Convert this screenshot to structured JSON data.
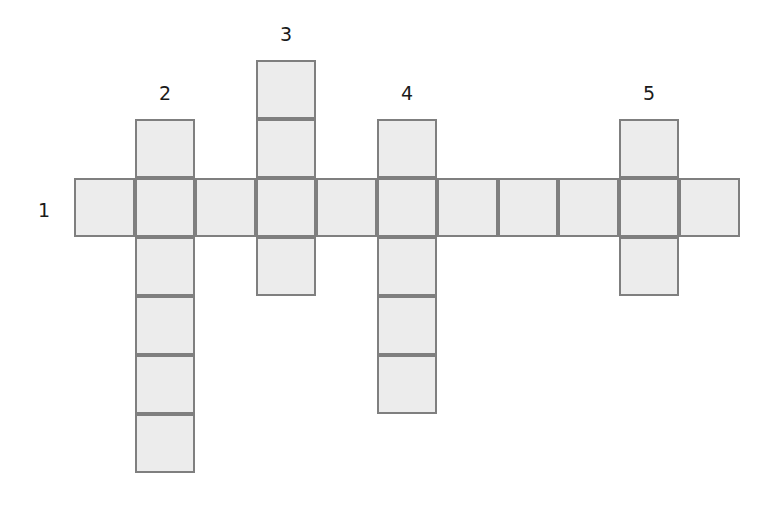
{
  "puzzle": {
    "type": "crossword",
    "colors": {
      "cell_fill": "#ececec",
      "cell_border": "#7f7f7f",
      "label": "#1a1a1a",
      "background": "#ffffff"
    },
    "cell_size": 60.5,
    "origin": {
      "x": 74,
      "y": 60
    },
    "row_height": 59,
    "words": [
      {
        "number": "1",
        "direction": "across",
        "row": 2,
        "col": 0,
        "length": 11,
        "label_pos": {
          "x": 38,
          "y": 201
        }
      },
      {
        "number": "2",
        "direction": "down",
        "row": 1,
        "col": 1,
        "length": 6,
        "label_pos": {
          "x": 159,
          "y": 84
        }
      },
      {
        "number": "3",
        "direction": "down",
        "row": 0,
        "col": 3,
        "length": 4,
        "label_pos": {
          "x": 280,
          "y": 25
        }
      },
      {
        "number": "4",
        "direction": "down",
        "row": 1,
        "col": 5,
        "length": 5,
        "label_pos": {
          "x": 401,
          "y": 84
        }
      },
      {
        "number": "5",
        "direction": "down",
        "row": 1,
        "col": 9,
        "length": 3,
        "label_pos": {
          "x": 643,
          "y": 84
        }
      }
    ]
  }
}
